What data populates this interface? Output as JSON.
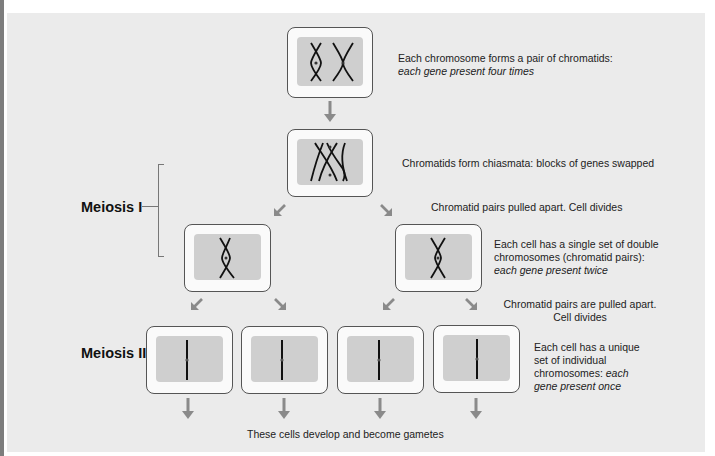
{
  "diagram": {
    "title": "Meiosis",
    "stages": {
      "meiosis_1_label": "Meiosis I",
      "meiosis_2_label": "Meiosis II"
    },
    "annotations": {
      "step1_line1": "Each chromosome forms a pair of chromatids:",
      "step1_line2": "each gene present four times",
      "step2": "Chromatids form chiasmata: blocks of genes swapped",
      "step3": "Chromatid pairs pulled apart.  Cell divides",
      "step4_line1": "Each cell has a single set of double",
      "step4_line2": "chromosomes (chromatid pairs):",
      "step4_line3": "each gene present twice",
      "step5_line1": "Chromatid pairs are pulled apart.",
      "step5_line2": "Cell divides",
      "step6_line1": "Each cell has a unique",
      "step6_line2": "set of individual",
      "step6_line3_plain": "chromosomes: ",
      "step6_line3_italic": "each",
      "step6_line4": "gene present once",
      "final": "These cells develop and become gametes"
    },
    "cells": [
      {
        "id": "parent",
        "content": "two-x-chromosomes"
      },
      {
        "id": "chiasmata",
        "content": "crossed-chromatids"
      },
      {
        "id": "meiosis1-left",
        "content": "single-x-chromosome"
      },
      {
        "id": "meiosis1-right",
        "content": "single-x-chromosome"
      },
      {
        "id": "gamete-1",
        "content": "single-chromatid"
      },
      {
        "id": "gamete-2",
        "content": "single-chromatid"
      },
      {
        "id": "gamete-3",
        "content": "single-chromatid"
      },
      {
        "id": "gamete-4",
        "content": "single-chromatid"
      }
    ],
    "colors": {
      "panel_bg": "#ebebeb",
      "cell_outer": "#fafafa",
      "cell_inner": "#cfcfcf",
      "arrow": "#8a8a8a",
      "chromosome": "#111111"
    }
  }
}
